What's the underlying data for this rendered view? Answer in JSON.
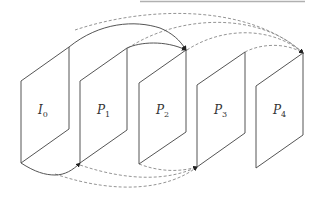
{
  "diagram": {
    "type": "frame prediction structure",
    "frames": [
      {
        "id": "I0",
        "base": "I",
        "sub": "0"
      },
      {
        "id": "P1",
        "base": "P",
        "sub": "1"
      },
      {
        "id": "P2",
        "base": "P",
        "sub": "2"
      },
      {
        "id": "P3",
        "base": "P",
        "sub": "3"
      },
      {
        "id": "P4",
        "base": "P",
        "sub": "4"
      }
    ],
    "references": [
      {
        "from": "I0",
        "to": "P1",
        "style": "solid",
        "side": "bottom"
      },
      {
        "from": "I0",
        "to": "P2",
        "style": "solid",
        "side": "top"
      },
      {
        "from": "P1",
        "to": "P2",
        "style": "solid",
        "side": "top"
      },
      {
        "from": "I0",
        "to": "P4",
        "style": "dashed",
        "side": "top"
      },
      {
        "from": "P1",
        "to": "P4",
        "style": "dashed",
        "side": "top"
      },
      {
        "from": "P2",
        "to": "P4",
        "style": "dashed",
        "side": "top"
      },
      {
        "from": "P3",
        "to": "P4",
        "style": "dashed",
        "side": "top"
      },
      {
        "from": "I0",
        "to": "P3",
        "style": "dashed",
        "side": "bottom"
      },
      {
        "from": "P1",
        "to": "P3",
        "style": "dashed",
        "side": "bottom"
      },
      {
        "from": "P2",
        "to": "P3",
        "style": "dashed",
        "side": "bottom"
      }
    ]
  }
}
